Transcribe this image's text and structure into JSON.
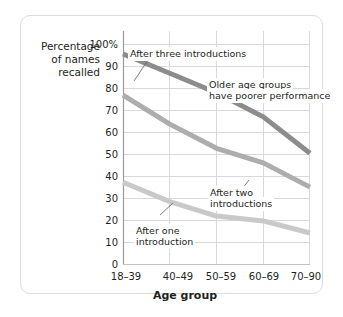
{
  "chart_data": {
    "type": "line",
    "title": "",
    "xlabel": "Age group",
    "ylabel": "Percentage of names recalled",
    "categories": [
      "18–39",
      "40–49",
      "50–59",
      "60–69",
      "70–90"
    ],
    "ylim": [
      0,
      100
    ],
    "yticks": [
      "0",
      "10",
      "20",
      "30",
      "40",
      "50",
      "60",
      "70",
      "80",
      "90",
      "100%"
    ],
    "grid": true,
    "legend_position": "inline-annotations",
    "series": [
      {
        "name": "After three introductions",
        "color": "#8c8c8c",
        "values": [
          87,
          79,
          71,
          61,
          46
        ]
      },
      {
        "name": "After two introductions",
        "color": "#adadad",
        "values": [
          70,
          58,
          48,
          42,
          32
        ]
      },
      {
        "name": "After one introduction",
        "color": "#c9c9c9",
        "values": [
          34,
          26,
          20,
          18,
          13
        ]
      }
    ],
    "annotations": [
      {
        "id": "ann-three",
        "text": "After three introductions"
      },
      {
        "id": "ann-two-line1",
        "text": "After two"
      },
      {
        "id": "ann-two-line2",
        "text": "introductions"
      },
      {
        "id": "ann-one-line1",
        "text": "After one"
      },
      {
        "id": "ann-one-line2",
        "text": "introduction"
      },
      {
        "id": "ann-note-line1",
        "text": "Older age groups"
      },
      {
        "id": "ann-note-line2",
        "text": "have poorer performance"
      }
    ]
  },
  "ylabel_lines": {
    "line1": "Percentage",
    "line2": "of names",
    "line3": "recalled"
  },
  "colors": {
    "series_three": "#8c8c8c",
    "series_two": "#adadad",
    "series_one": "#c9c9c9",
    "grid": "#d9d9d9",
    "axis": "#9a9a9a",
    "text": "#231f20",
    "card_border": "#dcdcdc"
  }
}
